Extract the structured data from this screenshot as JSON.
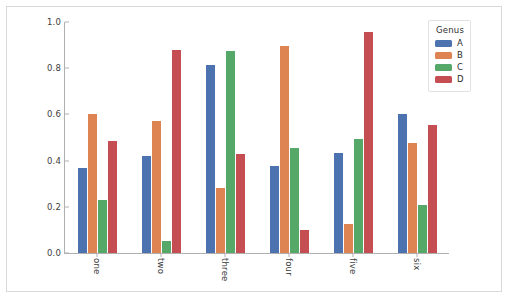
{
  "chart_data": {
    "type": "bar",
    "title": "",
    "xlabel": "",
    "ylabel": "",
    "ylim": [
      0.0,
      1.0
    ],
    "xlim_categories": [
      "one",
      "two",
      "three",
      "four",
      "five",
      "six"
    ],
    "categories": [
      "one",
      "two",
      "three",
      "four",
      "five",
      "six"
    ],
    "ytick_labels": [
      "0.0",
      "0.2",
      "0.4",
      "0.6",
      "0.8",
      "1.0"
    ],
    "ytick_values": [
      0.0,
      0.2,
      0.4,
      0.6,
      0.8,
      1.0
    ],
    "grid": false,
    "legend_position": "upper right outside",
    "legend_title": "Genus",
    "series": [
      {
        "name": "A",
        "color": "#4c72b0",
        "values": [
          0.37,
          0.42,
          0.815,
          0.375,
          0.435,
          0.6
        ]
      },
      {
        "name": "B",
        "color": "#dd8452",
        "values": [
          0.6,
          0.57,
          0.28,
          0.895,
          0.125,
          0.475
        ]
      },
      {
        "name": "C",
        "color": "#55a868",
        "values": [
          0.23,
          0.05,
          0.875,
          0.455,
          0.495,
          0.21
        ]
      },
      {
        "name": "D",
        "color": "#c44e52",
        "values": [
          0.485,
          0.88,
          0.43,
          0.1,
          0.955,
          0.555
        ]
      }
    ]
  },
  "figure": {
    "background_color": "#ffffff",
    "frame_color": "#d8d8d8",
    "axis_color": "#b0b0b0"
  }
}
